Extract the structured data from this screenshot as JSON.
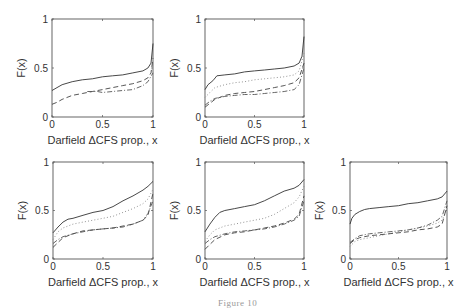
{
  "figure": {
    "caption": "Figure 10"
  },
  "chart_data": [
    {
      "type": "line",
      "panel": 1,
      "xlabel": "Darfield ΔCFS prop., x",
      "ylabel": "F(x)",
      "xlim": [
        0,
        1
      ],
      "ylim": [
        0,
        1
      ],
      "xticks": [
        "0",
        "0.5",
        "1"
      ],
      "yticks": [
        "0",
        "0.5",
        "1"
      ],
      "box": {
        "x": 52,
        "y": 19,
        "w": 101,
        "h": 98
      },
      "series": [
        {
          "name": "solid",
          "style": "solid",
          "x": [
            0,
            0.05,
            0.1,
            0.2,
            0.3,
            0.4,
            0.5,
            0.6,
            0.7,
            0.8,
            0.9,
            0.95,
            0.98,
            1.0
          ],
          "y": [
            0.27,
            0.3,
            0.33,
            0.36,
            0.38,
            0.39,
            0.41,
            0.42,
            0.43,
            0.45,
            0.47,
            0.5,
            0.55,
            0.75
          ]
        },
        {
          "name": "dashed",
          "style": "dashed",
          "x": [
            0,
            0.05,
            0.1,
            0.2,
            0.3,
            0.4,
            0.5,
            0.6,
            0.7,
            0.8,
            0.9,
            0.95,
            0.98,
            1.0
          ],
          "y": [
            0.13,
            0.15,
            0.18,
            0.22,
            0.24,
            0.26,
            0.28,
            0.3,
            0.32,
            0.34,
            0.37,
            0.4,
            0.45,
            0.6
          ]
        },
        {
          "name": "dash-dot",
          "style": "dashdot",
          "x": [
            0.35,
            0.45,
            0.5,
            0.6,
            0.7,
            0.8,
            0.9,
            0.95,
            1.0
          ],
          "y": [
            0.26,
            0.26,
            0.25,
            0.26,
            0.27,
            0.28,
            0.32,
            0.36,
            0.45
          ]
        }
      ]
    },
    {
      "type": "line",
      "panel": 2,
      "xlabel": "Darfield ΔCFS prop., x",
      "ylabel": "F(x)",
      "xlim": [
        0,
        1
      ],
      "ylim": [
        0,
        1
      ],
      "xticks": [
        "0",
        "0.5",
        "1"
      ],
      "yticks": [
        "0",
        "0.5",
        "1"
      ],
      "box": {
        "x": 205,
        "y": 19,
        "w": 99,
        "h": 98
      },
      "series": [
        {
          "name": "solid",
          "style": "solid",
          "x": [
            0,
            0.03,
            0.08,
            0.12,
            0.2,
            0.3,
            0.4,
            0.5,
            0.6,
            0.7,
            0.8,
            0.9,
            0.95,
            0.98,
            1.0
          ],
          "y": [
            0.28,
            0.33,
            0.37,
            0.42,
            0.43,
            0.44,
            0.46,
            0.47,
            0.48,
            0.49,
            0.5,
            0.52,
            0.55,
            0.62,
            0.82
          ]
        },
        {
          "name": "dotted",
          "style": "dotted",
          "x": [
            0,
            0.05,
            0.1,
            0.2,
            0.3,
            0.4,
            0.5,
            0.6,
            0.7,
            0.8,
            0.9,
            0.95,
            1.0
          ],
          "y": [
            0.2,
            0.25,
            0.3,
            0.33,
            0.35,
            0.36,
            0.38,
            0.39,
            0.4,
            0.41,
            0.43,
            0.47,
            0.65
          ]
        },
        {
          "name": "dashed",
          "style": "dashed",
          "x": [
            0,
            0.05,
            0.1,
            0.2,
            0.3,
            0.4,
            0.5,
            0.6,
            0.7,
            0.8,
            0.9,
            0.95,
            1.0
          ],
          "y": [
            0.1,
            0.14,
            0.18,
            0.22,
            0.24,
            0.25,
            0.26,
            0.28,
            0.3,
            0.32,
            0.35,
            0.4,
            0.55
          ]
        },
        {
          "name": "dash-dot",
          "style": "dashdot",
          "x": [
            0,
            0.05,
            0.1,
            0.2,
            0.3,
            0.4,
            0.5,
            0.6,
            0.7,
            0.8,
            0.9,
            0.95,
            1.0
          ],
          "y": [
            0.12,
            0.16,
            0.19,
            0.21,
            0.22,
            0.23,
            0.23,
            0.24,
            0.25,
            0.26,
            0.28,
            0.33,
            0.5
          ]
        }
      ]
    },
    {
      "type": "line",
      "panel": 3,
      "xlabel": "Darfield ΔCFS prop., x",
      "ylabel": "F(x)",
      "xlim": [
        0,
        1
      ],
      "ylim": [
        0,
        1
      ],
      "xticks": [
        "0",
        "0.5",
        "1"
      ],
      "yticks": [
        "0",
        "0.5",
        "1"
      ],
      "box": {
        "x": 53,
        "y": 162,
        "w": 100,
        "h": 97
      },
      "series": [
        {
          "name": "solid",
          "style": "solid",
          "x": [
            0,
            0.05,
            0.1,
            0.15,
            0.2,
            0.3,
            0.4,
            0.5,
            0.6,
            0.7,
            0.8,
            0.9,
            0.95,
            1.0
          ],
          "y": [
            0.27,
            0.33,
            0.38,
            0.41,
            0.42,
            0.45,
            0.48,
            0.5,
            0.54,
            0.6,
            0.65,
            0.71,
            0.75,
            0.8
          ]
        },
        {
          "name": "dotted",
          "style": "dotted",
          "x": [
            0,
            0.05,
            0.1,
            0.2,
            0.3,
            0.4,
            0.5,
            0.6,
            0.7,
            0.8,
            0.9,
            0.95,
            1.0
          ],
          "y": [
            0.2,
            0.28,
            0.32,
            0.36,
            0.38,
            0.4,
            0.42,
            0.44,
            0.48,
            0.52,
            0.57,
            0.62,
            0.72
          ]
        },
        {
          "name": "dashed",
          "style": "dashed",
          "x": [
            0,
            0.05,
            0.1,
            0.2,
            0.3,
            0.4,
            0.5,
            0.6,
            0.7,
            0.8,
            0.9,
            0.95,
            1.0
          ],
          "y": [
            0.12,
            0.17,
            0.22,
            0.26,
            0.29,
            0.3,
            0.31,
            0.32,
            0.34,
            0.36,
            0.4,
            0.45,
            0.68
          ]
        },
        {
          "name": "dash-dot",
          "style": "dashdot",
          "x": [
            0,
            0.05,
            0.1,
            0.2,
            0.3,
            0.4,
            0.5,
            0.6,
            0.7,
            0.8,
            0.9,
            0.95,
            1.0
          ],
          "y": [
            0.16,
            0.2,
            0.23,
            0.26,
            0.28,
            0.3,
            0.31,
            0.32,
            0.33,
            0.36,
            0.4,
            0.47,
            0.6
          ]
        }
      ]
    },
    {
      "type": "line",
      "panel": 4,
      "xlabel": "Darfield ΔCFS prop., x",
      "ylabel": "F(x)",
      "xlim": [
        0,
        1
      ],
      "ylim": [
        0,
        1
      ],
      "xticks": [
        "0",
        "0.5",
        "1"
      ],
      "yticks": [
        "0",
        "0.5",
        "1"
      ],
      "box": {
        "x": 205,
        "y": 162,
        "w": 99,
        "h": 97
      },
      "series": [
        {
          "name": "solid",
          "style": "solid",
          "x": [
            0,
            0.05,
            0.1,
            0.15,
            0.2,
            0.3,
            0.4,
            0.5,
            0.6,
            0.7,
            0.8,
            0.9,
            0.95,
            1.0
          ],
          "y": [
            0.28,
            0.36,
            0.43,
            0.48,
            0.5,
            0.52,
            0.54,
            0.56,
            0.6,
            0.65,
            0.7,
            0.73,
            0.76,
            0.82
          ]
        },
        {
          "name": "dotted",
          "style": "dotted",
          "x": [
            0,
            0.05,
            0.1,
            0.2,
            0.3,
            0.4,
            0.5,
            0.6,
            0.7,
            0.8,
            0.9,
            0.95,
            1.0
          ],
          "y": [
            0.18,
            0.25,
            0.3,
            0.34,
            0.36,
            0.38,
            0.4,
            0.42,
            0.46,
            0.52,
            0.58,
            0.64,
            0.75
          ]
        },
        {
          "name": "dashed",
          "style": "dashed",
          "x": [
            0,
            0.05,
            0.1,
            0.2,
            0.3,
            0.4,
            0.5,
            0.6,
            0.7,
            0.8,
            0.9,
            0.95,
            1.0
          ],
          "y": [
            0.1,
            0.15,
            0.2,
            0.25,
            0.27,
            0.28,
            0.3,
            0.32,
            0.34,
            0.37,
            0.41,
            0.46,
            0.65
          ]
        },
        {
          "name": "dash-dot",
          "style": "dashdot",
          "x": [
            0,
            0.05,
            0.1,
            0.2,
            0.3,
            0.4,
            0.5,
            0.6,
            0.7,
            0.8,
            0.9,
            0.95,
            1.0
          ],
          "y": [
            0.16,
            0.2,
            0.23,
            0.26,
            0.28,
            0.29,
            0.3,
            0.31,
            0.33,
            0.36,
            0.4,
            0.44,
            0.6
          ]
        }
      ]
    },
    {
      "type": "line",
      "panel": 5,
      "xlabel": "Darfield ΔCFS prop., x",
      "ylabel": "F(x)",
      "xlim": [
        0,
        1
      ],
      "ylim": [
        0,
        1
      ],
      "xticks": [
        "0",
        "0.5",
        "1"
      ],
      "yticks": [
        "0",
        "0.5",
        "1"
      ],
      "box": {
        "x": 350,
        "y": 162,
        "w": 97,
        "h": 97
      },
      "series": [
        {
          "name": "solid",
          "style": "solid",
          "x": [
            0,
            0.02,
            0.05,
            0.1,
            0.15,
            0.2,
            0.3,
            0.4,
            0.5,
            0.6,
            0.7,
            0.8,
            0.9,
            0.95,
            1.0
          ],
          "y": [
            0.36,
            0.42,
            0.46,
            0.49,
            0.51,
            0.52,
            0.53,
            0.54,
            0.55,
            0.57,
            0.58,
            0.6,
            0.62,
            0.64,
            0.7
          ]
        },
        {
          "name": "dotted",
          "style": "dotted",
          "x": [
            0,
            0.05,
            0.1,
            0.2,
            0.3,
            0.4,
            0.5,
            0.6,
            0.7,
            0.8,
            0.9,
            0.95,
            1.0
          ],
          "y": [
            0.13,
            0.18,
            0.2,
            0.22,
            0.24,
            0.26,
            0.28,
            0.3,
            0.32,
            0.34,
            0.37,
            0.4,
            0.52
          ]
        },
        {
          "name": "dashed",
          "style": "dashed",
          "x": [
            0,
            0.05,
            0.1,
            0.2,
            0.3,
            0.4,
            0.5,
            0.6,
            0.7,
            0.8,
            0.9,
            0.95,
            1.0
          ],
          "y": [
            0.16,
            0.2,
            0.22,
            0.24,
            0.25,
            0.26,
            0.27,
            0.28,
            0.3,
            0.31,
            0.33,
            0.36,
            0.55
          ]
        },
        {
          "name": "dash-dot",
          "style": "dashdot",
          "x": [
            0,
            0.05,
            0.1,
            0.2,
            0.3,
            0.4,
            0.5,
            0.6,
            0.7,
            0.8,
            0.9,
            0.95,
            1.0
          ],
          "y": [
            0.17,
            0.21,
            0.24,
            0.26,
            0.27,
            0.28,
            0.29,
            0.3,
            0.32,
            0.35,
            0.4,
            0.44,
            0.6
          ]
        }
      ]
    }
  ]
}
